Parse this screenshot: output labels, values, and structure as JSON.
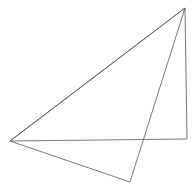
{
  "diagram": {
    "background": "#ffffff",
    "stroke_color": "#555555",
    "stroke_width": 0.8,
    "vertices": {
      "top_right": [
        185,
        8
      ],
      "left": [
        10,
        141
      ],
      "right": [
        187,
        139
      ],
      "bottom": [
        130,
        182
      ]
    },
    "shapes": [
      {
        "name": "triangle-a",
        "points": [
          [
            185,
            8
          ],
          [
            10,
            141
          ],
          [
            187,
            139
          ]
        ]
      },
      {
        "name": "triangle-b",
        "points": [
          [
            185,
            8
          ],
          [
            10,
            141
          ],
          [
            130,
            182
          ]
        ]
      }
    ]
  }
}
